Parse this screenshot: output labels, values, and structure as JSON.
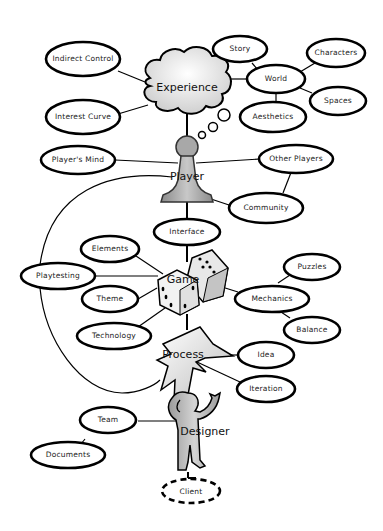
{
  "diagram": {
    "hubs": {
      "experience": "Experience",
      "player": "Player",
      "game": "Game",
      "process": "Process",
      "designer": "Designer"
    },
    "nodes": {
      "indirect_control": "Indirect Control",
      "interest_curve": "Interest Curve",
      "story": "Story",
      "world": "World",
      "characters": "Characters",
      "spaces": "Spaces",
      "aesthetics": "Aesthetics",
      "players_mind": "Player's Mind",
      "other_players": "Other Players",
      "community": "Community",
      "interface": "Interface",
      "elements": "Elements",
      "playtesting": "Playtesting",
      "theme": "Theme",
      "technology": "Technology",
      "puzzles": "Puzzles",
      "mechanics": "Mechanics",
      "balance": "Balance",
      "idea": "Idea",
      "iteration": "Iteration",
      "team": "Team",
      "documents": "Documents",
      "client": "Client"
    },
    "edges": [
      [
        "Experience",
        "Indirect Control"
      ],
      [
        "Experience",
        "Interest Curve"
      ],
      [
        "Experience",
        "World"
      ],
      [
        "World",
        "Story"
      ],
      [
        "World",
        "Characters"
      ],
      [
        "World",
        "Spaces"
      ],
      [
        "World",
        "Aesthetics"
      ],
      [
        "Experience",
        "Player"
      ],
      [
        "Player",
        "Player's Mind"
      ],
      [
        "Player",
        "Other Players"
      ],
      [
        "Player",
        "Community"
      ],
      [
        "Other Players",
        "Community"
      ],
      [
        "Player",
        "Interface"
      ],
      [
        "Interface",
        "Game"
      ],
      [
        "Game",
        "Elements"
      ],
      [
        "Game",
        "Playtesting"
      ],
      [
        "Game",
        "Theme"
      ],
      [
        "Game",
        "Technology"
      ],
      [
        "Game",
        "Mechanics"
      ],
      [
        "Mechanics",
        "Puzzles"
      ],
      [
        "Mechanics",
        "Balance"
      ],
      [
        "Game",
        "Process"
      ],
      [
        "Process",
        "Idea"
      ],
      [
        "Process",
        "Iteration"
      ],
      [
        "Process",
        "Designer"
      ],
      [
        "Designer",
        "Team"
      ],
      [
        "Team",
        "Documents"
      ],
      [
        "Designer",
        "Client"
      ],
      [
        "Player",
        "Process (loop via Playtesting)"
      ]
    ]
  }
}
